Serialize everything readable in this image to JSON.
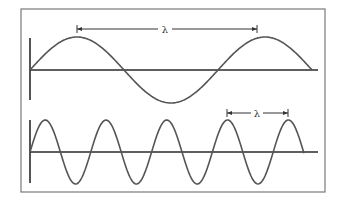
{
  "diagram": {
    "panels": [
      {
        "name": "long-wavelength",
        "wavelength_label": "λ",
        "description": "Low-frequency sine wave (about 1.5 cycles)"
      },
      {
        "name": "short-wavelength",
        "wavelength_label": "λ",
        "description": "High-frequency sine wave (about 4.5 cycles)"
      }
    ],
    "colors": {
      "frame": "#7a7a7a",
      "axis": "#2a2a2a",
      "wave": "#555555",
      "background": "#ffffff"
    }
  }
}
